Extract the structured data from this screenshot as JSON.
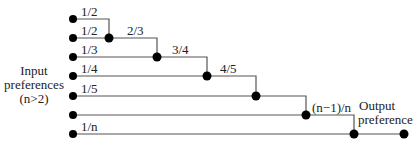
{
  "diagram": {
    "input_label": [
      "Input",
      "preferences",
      "(n>2)"
    ],
    "output_label": [
      "Output",
      "preference"
    ],
    "input_weights": [
      "1/2",
      "1/2",
      "1/3",
      "1/4",
      "1/5",
      "",
      "1/n"
    ],
    "merge_weights": [
      "2/3",
      "3/4",
      "4/5",
      "(n−1)/n"
    ],
    "colors": {
      "line": "#555555",
      "dot": "#000000",
      "text": "#222222"
    }
  }
}
